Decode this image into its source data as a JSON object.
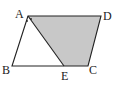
{
  "figure": {
    "type": "parallelogram with shaded trapezoid",
    "points": {
      "A": {
        "label": "A",
        "x": 28,
        "y": 16
      },
      "B": {
        "label": "B",
        "x": 12,
        "y": 66
      },
      "C": {
        "label": "C",
        "x": 88,
        "y": 66
      },
      "D": {
        "label": "D",
        "x": 101,
        "y": 16
      },
      "E": {
        "label": "E",
        "x": 64,
        "y": 66
      }
    },
    "shaded_region": "AECD",
    "colors": {
      "stroke": "#222222",
      "fill": "#c8c8c8",
      "background": "#ffffff"
    }
  }
}
